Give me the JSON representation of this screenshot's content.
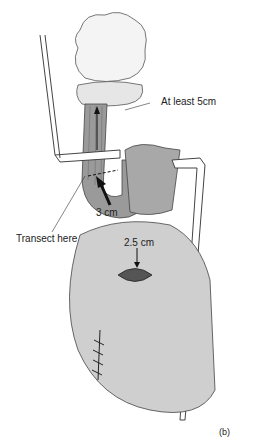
{
  "figure": {
    "panel_label": "(b)",
    "labels": {
      "at_least": "At least 5cm",
      "transect": "Transect here",
      "three_cm": "3 cm",
      "two_five_cm": "2.5 cm"
    }
  }
}
